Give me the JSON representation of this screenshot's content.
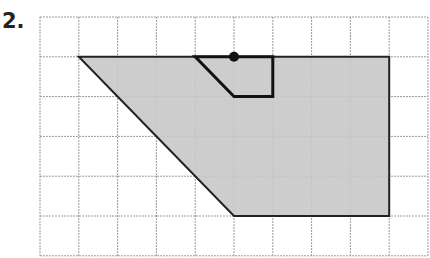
{
  "problem": {
    "number_label": "2."
  },
  "grid": {
    "cols": 10,
    "rows": 6,
    "origin_x": 40,
    "origin_y": 17,
    "cell_w": 38.8,
    "cell_h": 39.8,
    "line_color": "#9a9a9a"
  },
  "shapes": {
    "large_figure": {
      "points_grid": [
        [
          1,
          1
        ],
        [
          9,
          1
        ],
        [
          9,
          5
        ],
        [
          5,
          5
        ]
      ],
      "fill": "#c8c8c8",
      "stroke": "#222222"
    },
    "small_figure": {
      "points_grid": [
        [
          4,
          1
        ],
        [
          6,
          1
        ],
        [
          6,
          2
        ],
        [
          5,
          2
        ]
      ],
      "fill": "none",
      "stroke": "#111111"
    },
    "center_dot": {
      "point_grid": [
        5,
        1
      ],
      "color": "#111111"
    }
  }
}
